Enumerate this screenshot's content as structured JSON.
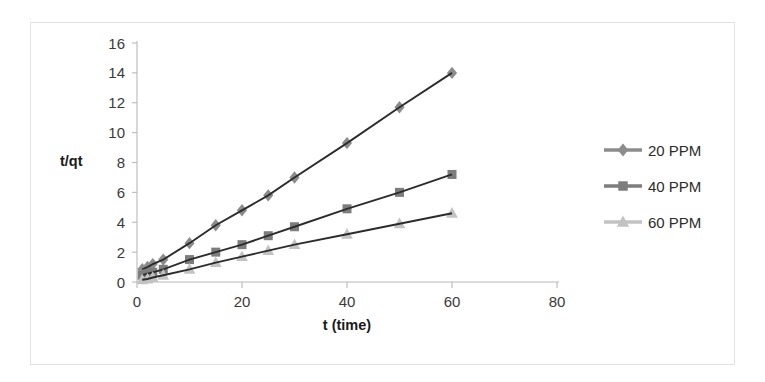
{
  "chart_data": {
    "type": "line",
    "title": "",
    "xlabel": "t (time)",
    "ylabel": "t/qt",
    "xlim": [
      0,
      80
    ],
    "ylim": [
      0,
      16
    ],
    "xticks": [
      0,
      20,
      40,
      60,
      80
    ],
    "yticks": [
      0,
      2,
      4,
      6,
      8,
      10,
      12,
      14,
      16
    ],
    "grid": false,
    "legend_position": "right",
    "x": [
      1,
      2,
      3,
      5,
      10,
      15,
      20,
      25,
      30,
      40,
      50,
      60
    ],
    "series": [
      {
        "name": "20 PPM",
        "marker": "diamond",
        "color": "#8c8c8c",
        "values": [
          0.85,
          1.0,
          1.2,
          1.5,
          2.6,
          3.8,
          4.8,
          5.8,
          7.0,
          9.3,
          11.7,
          14.0
        ]
      },
      {
        "name": "40 PPM",
        "marker": "square",
        "color": "#7d7d7d",
        "values": [
          0.45,
          0.55,
          0.65,
          0.85,
          1.5,
          2.0,
          2.5,
          3.1,
          3.7,
          4.9,
          6.0,
          7.2
        ]
      },
      {
        "name": "60 PPM",
        "marker": "triangle",
        "color": "#c3c3c3",
        "values": [
          0.15,
          0.2,
          0.3,
          0.45,
          0.85,
          1.3,
          1.7,
          2.1,
          2.5,
          3.2,
          3.9,
          4.6
        ]
      }
    ]
  },
  "legend": {
    "items": [
      {
        "label": "20 PPM"
      },
      {
        "label": "40 PPM"
      },
      {
        "label": "60 PPM"
      }
    ]
  },
  "axes": {
    "y_title": "t/qt",
    "x_title": "t (time)",
    "x_tick_labels": [
      "0",
      "20",
      "40",
      "60",
      "80"
    ],
    "y_tick_labels": [
      "0",
      "2",
      "4",
      "6",
      "8",
      "10",
      "12",
      "14",
      "16"
    ]
  },
  "colors": {
    "line": "#2c2c2c",
    "axis": "#b9b9b9",
    "frame": "#e2e2e2",
    "text": "#2b2b2b"
  }
}
